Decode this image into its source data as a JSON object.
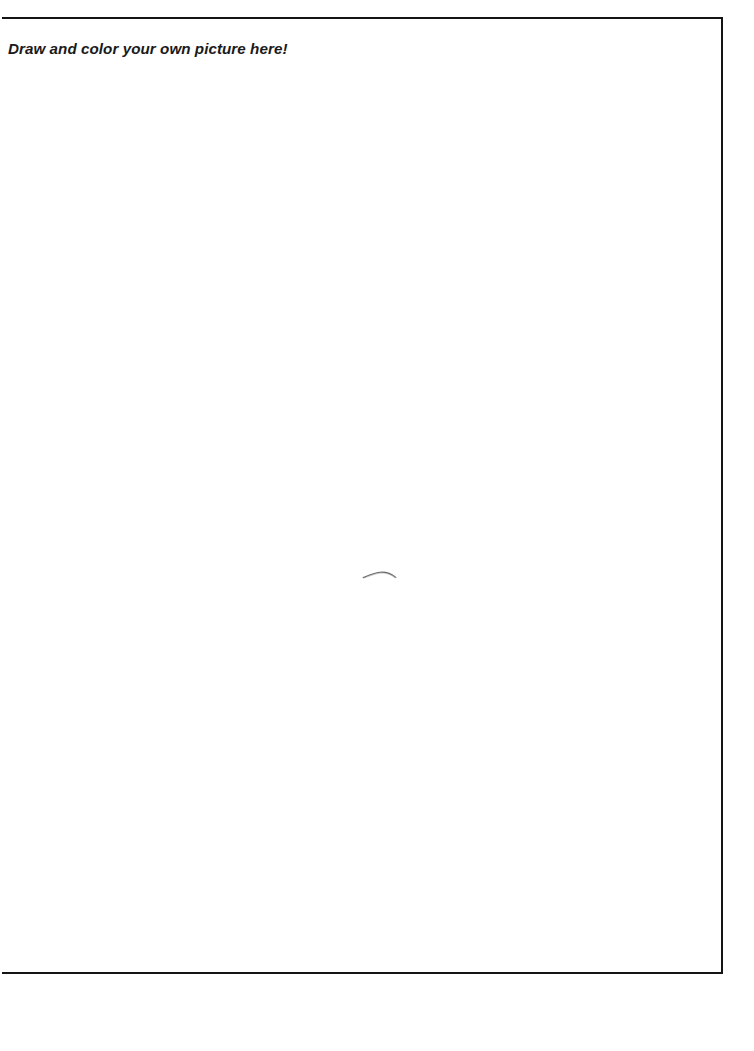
{
  "page": {
    "background_color": "#ffffff",
    "width": 754,
    "height": 1051
  },
  "activity": {
    "title": "Draw and color your own picture here!",
    "title_color": "#1a1a1a",
    "frame": {
      "border_color": "#141414",
      "border_width_px": 2,
      "open_side": "left",
      "fill_color": "#ffffff"
    },
    "canvas": {
      "content": "",
      "placeholder": "Draw and color your own picture here!",
      "is_blank": true
    },
    "marks": [
      {
        "name": "stray-pencil-stroke",
        "description": "faint hand-drawn curved pencil line",
        "color": "#4a4a4a"
      }
    ]
  }
}
